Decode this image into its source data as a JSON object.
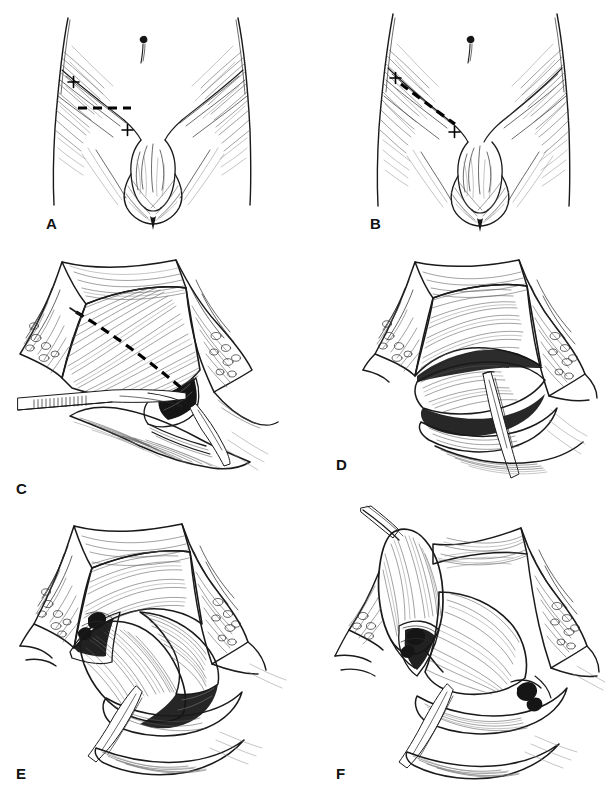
{
  "figure": {
    "kind": "surgical-atlas-line-drawing",
    "background_color": "#ffffff",
    "ink_color": "#1a1a1a",
    "width": 610,
    "height": 790,
    "panel_count": 6,
    "columns": 2,
    "rows": 3
  },
  "panels": [
    {
      "id": "A",
      "label": "A",
      "label_x": 46,
      "label_y": 216,
      "subject": "anterior-view-lower-abdomen-and-groin",
      "description": "Anterior surface view of the lower abdomen, groin and external genitalia showing the planned transverse skin incision.",
      "markings": {
        "incision_style": "dashed",
        "incision_orientation": "transverse-horizontal",
        "incision_color": "#000000",
        "landmark_markers": "+",
        "landmark_count": 2,
        "landmark_upper": "anterior-superior-iliac-spine",
        "landmark_lower": "pubic-tubercle"
      },
      "features": [
        "umbilicus",
        "left-torso-outline",
        "right-torso-outline",
        "inguinal-crease",
        "penis",
        "scrotum"
      ]
    },
    {
      "id": "B",
      "label": "B",
      "label_x": 370,
      "label_y": 216,
      "subject": "anterior-view-lower-abdomen-and-groin",
      "description": "Same anterior view with an alternative oblique incision drawn parallel to and above the inguinal ligament.",
      "markings": {
        "incision_style": "dashed",
        "incision_orientation": "oblique-curved-along-inguinal-ligament",
        "incision_color": "#000000",
        "landmark_markers": "+",
        "landmark_count": 2,
        "landmark_upper": "anterior-superior-iliac-spine",
        "landmark_lower": "pubic-tubercle"
      },
      "features": [
        "umbilicus",
        "left-torso-outline",
        "right-torso-outline",
        "inguinal-crease",
        "penis",
        "scrotum"
      ]
    },
    {
      "id": "C",
      "label": "C",
      "label_x": 16,
      "label_y": 481,
      "subject": "open-inguinal-wound-external-oblique-aponeurosis",
      "description": "Wound opened with retractors exposing the external oblique aponeurosis; dashed line marks the line of incision of the aponeurosis through the external ring. A forceps lies in the field.",
      "markings": {
        "incision_style": "dashed",
        "incision_orientation": "oblique-along-aponeurosis-fibres",
        "incision_color": "#000000"
      },
      "features": [
        "skin-edge",
        "subcutaneous-fat",
        "external-oblique-aponeurosis",
        "retractor-left",
        "retractor-right",
        "forceps-instrument",
        "external-inguinal-ring"
      ]
    },
    {
      "id": "D",
      "label": "D",
      "label_x": 336,
      "label_y": 457,
      "subject": "aponeurosis-divided-cord-encircled",
      "description": "External oblique aponeurosis divided and its leaves reflected; the spermatic cord is mobilised and encircled, elevated on a clamp.",
      "markings": {},
      "features": [
        "skin-edge",
        "subcutaneous-fat",
        "aponeurotic-leaf-upper",
        "aponeurotic-leaf-lower",
        "spermatic-cord",
        "clamp-instrument",
        "inguinal-ligament"
      ]
    },
    {
      "id": "E",
      "label": "E",
      "label_x": 16,
      "label_y": 766,
      "subject": "hernia-sac-dissected-from-cord",
      "description": "Indirect hernia sac separated from the cord structures and delivered into the wound; cord retracted on a loop.",
      "markings": {},
      "features": [
        "skin-edge",
        "subcutaneous-fat",
        "aponeurotic-leaf-upper",
        "hernia-sac",
        "spermatic-cord",
        "clamp-instrument",
        "internal-ring",
        "conjoint-tendon"
      ]
    },
    {
      "id": "F",
      "label": "F",
      "label_x": 336,
      "label_y": 766,
      "subject": "hernia-sac-elevated-and-twisted",
      "description": "Hernia sac fully freed, elevated superolaterally on a clamp and twisted prior to high ligation at the internal ring.",
      "markings": {},
      "features": [
        "skin-edge",
        "subcutaneous-fat",
        "aponeurotic-leaf-upper",
        "hernia-sac-elevated",
        "clamp-on-sac",
        "spermatic-cord",
        "internal-ring",
        "inguinal-ligament"
      ]
    }
  ]
}
